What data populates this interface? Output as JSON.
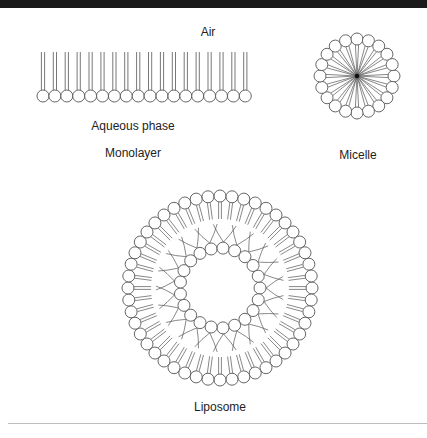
{
  "labels": {
    "air": "Air",
    "aqueous": "Aqueous phase",
    "monolayer": "Monolayer",
    "micelle": "Micelle",
    "liposome": "Liposome"
  },
  "colors": {
    "stroke": "#555555",
    "background": "#ffffff",
    "topbar": "#1a1a1a",
    "rule": "#bdbdbd"
  },
  "geometry": {
    "monolayer": {
      "x0": 43,
      "spacing": 11.9,
      "count": 18,
      "head_y": 96,
      "head_r": 6,
      "tail_top": 52
    },
    "micelle": {
      "cx": 357,
      "cy": 76,
      "ring_r": 37,
      "head_r": 6,
      "count": 20
    },
    "liposome": {
      "cx": 220,
      "cy": 288,
      "outer_r": 92,
      "outer_count": 48,
      "inner_r": 40,
      "inner_count": 21,
      "head_r": 6
    }
  }
}
